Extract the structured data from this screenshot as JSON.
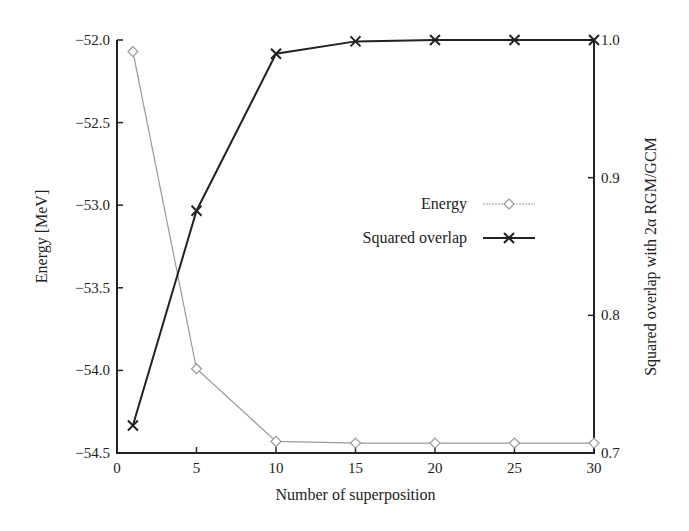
{
  "chart_data": {
    "type": "line",
    "title": "",
    "xlabel": "Number of superposition",
    "ylabel": "Energy [MeV]",
    "ylabel_right": "Squared overlap with 2α RGM/GCM",
    "xlim": [
      0,
      30
    ],
    "ylim": [
      -54.5,
      -52.0
    ],
    "ylim_right": [
      0.7,
      1.0
    ],
    "x_ticks": [
      "0",
      "5",
      "10",
      "15",
      "20",
      "25",
      "30"
    ],
    "y_ticks": [
      "−52.0",
      "−52.5",
      "−53.0",
      "−53.5",
      "−54.0",
      "−54.5"
    ],
    "y_ticks_right": [
      "1.0",
      "0.9",
      "0.8",
      "0.7"
    ],
    "grid": false,
    "legend_position": "center-right",
    "x": [
      1,
      5,
      10,
      15,
      20,
      25,
      30
    ],
    "series": [
      {
        "name": "Energy",
        "axis": "left",
        "marker": "diamond",
        "color": "#999999",
        "values": [
          -52.07,
          -53.99,
          -54.43,
          -54.44,
          -54.44,
          -54.44,
          -54.44
        ]
      },
      {
        "name": "Squared overlap",
        "axis": "right",
        "marker": "x",
        "color": "#222222",
        "values": [
          0.72,
          0.876,
          0.99,
          0.999,
          1.0,
          1.0,
          1.0
        ]
      }
    ]
  },
  "legend": {
    "energy_label": "Energy",
    "overlap_label": "Squared overlap"
  }
}
